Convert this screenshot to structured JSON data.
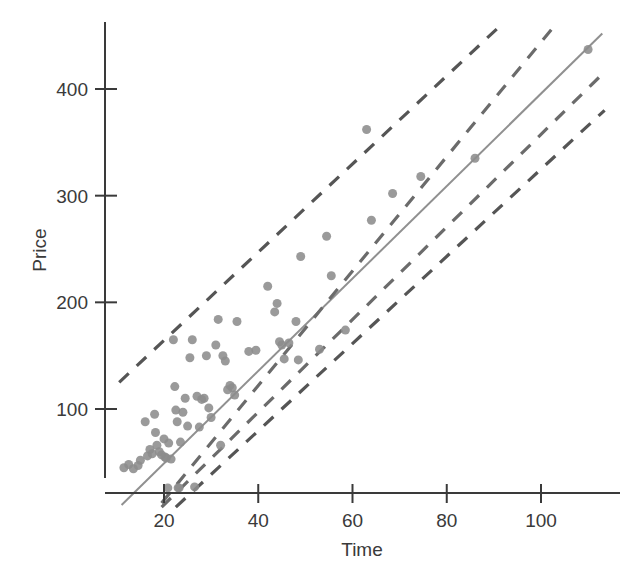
{
  "chart_data": {
    "type": "scatter",
    "title": "",
    "xlabel": "Time",
    "ylabel": "Price",
    "xlim": [
      8,
      120
    ],
    "ylim": [
      5,
      465
    ],
    "xticks": [
      20,
      40,
      60,
      80,
      100
    ],
    "yticks": [
      100,
      200,
      300,
      400
    ],
    "xtick_labels": [
      "20",
      "40",
      "60",
      "80",
      "100"
    ],
    "ytick_labels": [
      "100",
      "200",
      "300",
      "400"
    ],
    "grid": false,
    "legend": "none",
    "marker": {
      "shape": "circle",
      "color": "#8c8c8c",
      "size": 9
    },
    "points": [
      [
        11.5,
        45
      ],
      [
        12.5,
        48
      ],
      [
        13.5,
        44
      ],
      [
        14.5,
        47
      ],
      [
        15.0,
        52
      ],
      [
        16.0,
        88
      ],
      [
        16.5,
        56
      ],
      [
        17.0,
        62
      ],
      [
        17.5,
        58
      ],
      [
        18.0,
        95
      ],
      [
        18.2,
        78
      ],
      [
        18.5,
        66
      ],
      [
        19.0,
        60
      ],
      [
        19.5,
        57
      ],
      [
        20.0,
        72
      ],
      [
        20.2,
        55
      ],
      [
        20.5,
        54
      ],
      [
        20.8,
        26
      ],
      [
        21.0,
        68
      ],
      [
        21.5,
        53
      ],
      [
        22.0,
        165
      ],
      [
        22.3,
        121
      ],
      [
        22.5,
        99
      ],
      [
        22.8,
        88
      ],
      [
        23.0,
        26
      ],
      [
        23.2,
        26
      ],
      [
        23.5,
        69
      ],
      [
        24.0,
        97
      ],
      [
        24.5,
        110
      ],
      [
        25.0,
        84
      ],
      [
        25.5,
        148
      ],
      [
        26.0,
        165
      ],
      [
        26.5,
        27
      ],
      [
        27.0,
        112
      ],
      [
        27.5,
        83
      ],
      [
        28.0,
        109
      ],
      [
        28.5,
        110
      ],
      [
        29.0,
        150
      ],
      [
        29.5,
        101
      ],
      [
        30.0,
        92
      ],
      [
        31.0,
        160
      ],
      [
        31.5,
        184
      ],
      [
        32.0,
        66
      ],
      [
        32.5,
        150
      ],
      [
        33.0,
        145
      ],
      [
        33.5,
        118
      ],
      [
        34.0,
        122
      ],
      [
        34.5,
        120
      ],
      [
        35.0,
        113
      ],
      [
        35.5,
        182
      ],
      [
        38.0,
        154
      ],
      [
        39.5,
        155
      ],
      [
        42.0,
        215
      ],
      [
        43.5,
        191
      ],
      [
        44.0,
        199
      ],
      [
        44.5,
        163
      ],
      [
        45.0,
        160
      ],
      [
        45.5,
        147
      ],
      [
        46.5,
        162
      ],
      [
        48.0,
        182
      ],
      [
        48.5,
        146
      ],
      [
        49.0,
        243
      ],
      [
        53.0,
        156
      ],
      [
        54.5,
        262
      ],
      [
        55.5,
        225
      ],
      [
        58.5,
        174
      ],
      [
        63.0,
        362
      ],
      [
        64.0,
        277
      ],
      [
        68.5,
        302
      ],
      [
        74.5,
        318
      ],
      [
        86.0,
        335
      ],
      [
        110.0,
        437
      ]
    ],
    "lines": [
      {
        "name": "regression-line",
        "style": "solid",
        "color": "#909090",
        "x1": 11.0,
        "y1": 10,
        "x2": 113.0,
        "y2": 452
      },
      {
        "name": "upper-prediction-band",
        "style": "dashed",
        "color": "#555555",
        "x1": 10.5,
        "y1": 125,
        "x2": 92.0,
        "y2": 462
      },
      {
        "name": "upper-confidence-band",
        "style": "dashed",
        "color": "#6b6b6b",
        "x1": 19.5,
        "y1": 12,
        "x2": 103.0,
        "y2": 460
      },
      {
        "name": "lower-confidence-band",
        "style": "dashed",
        "color": "#6b6b6b",
        "x1": 19.5,
        "y1": 8,
        "x2": 113.5,
        "y2": 416
      },
      {
        "name": "lower-prediction-band",
        "style": "dashed",
        "color": "#555555",
        "x1": 22.5,
        "y1": 8,
        "x2": 113.5,
        "y2": 380
      }
    ]
  },
  "axes": {
    "x_title": "Time",
    "y_title": "Price"
  }
}
